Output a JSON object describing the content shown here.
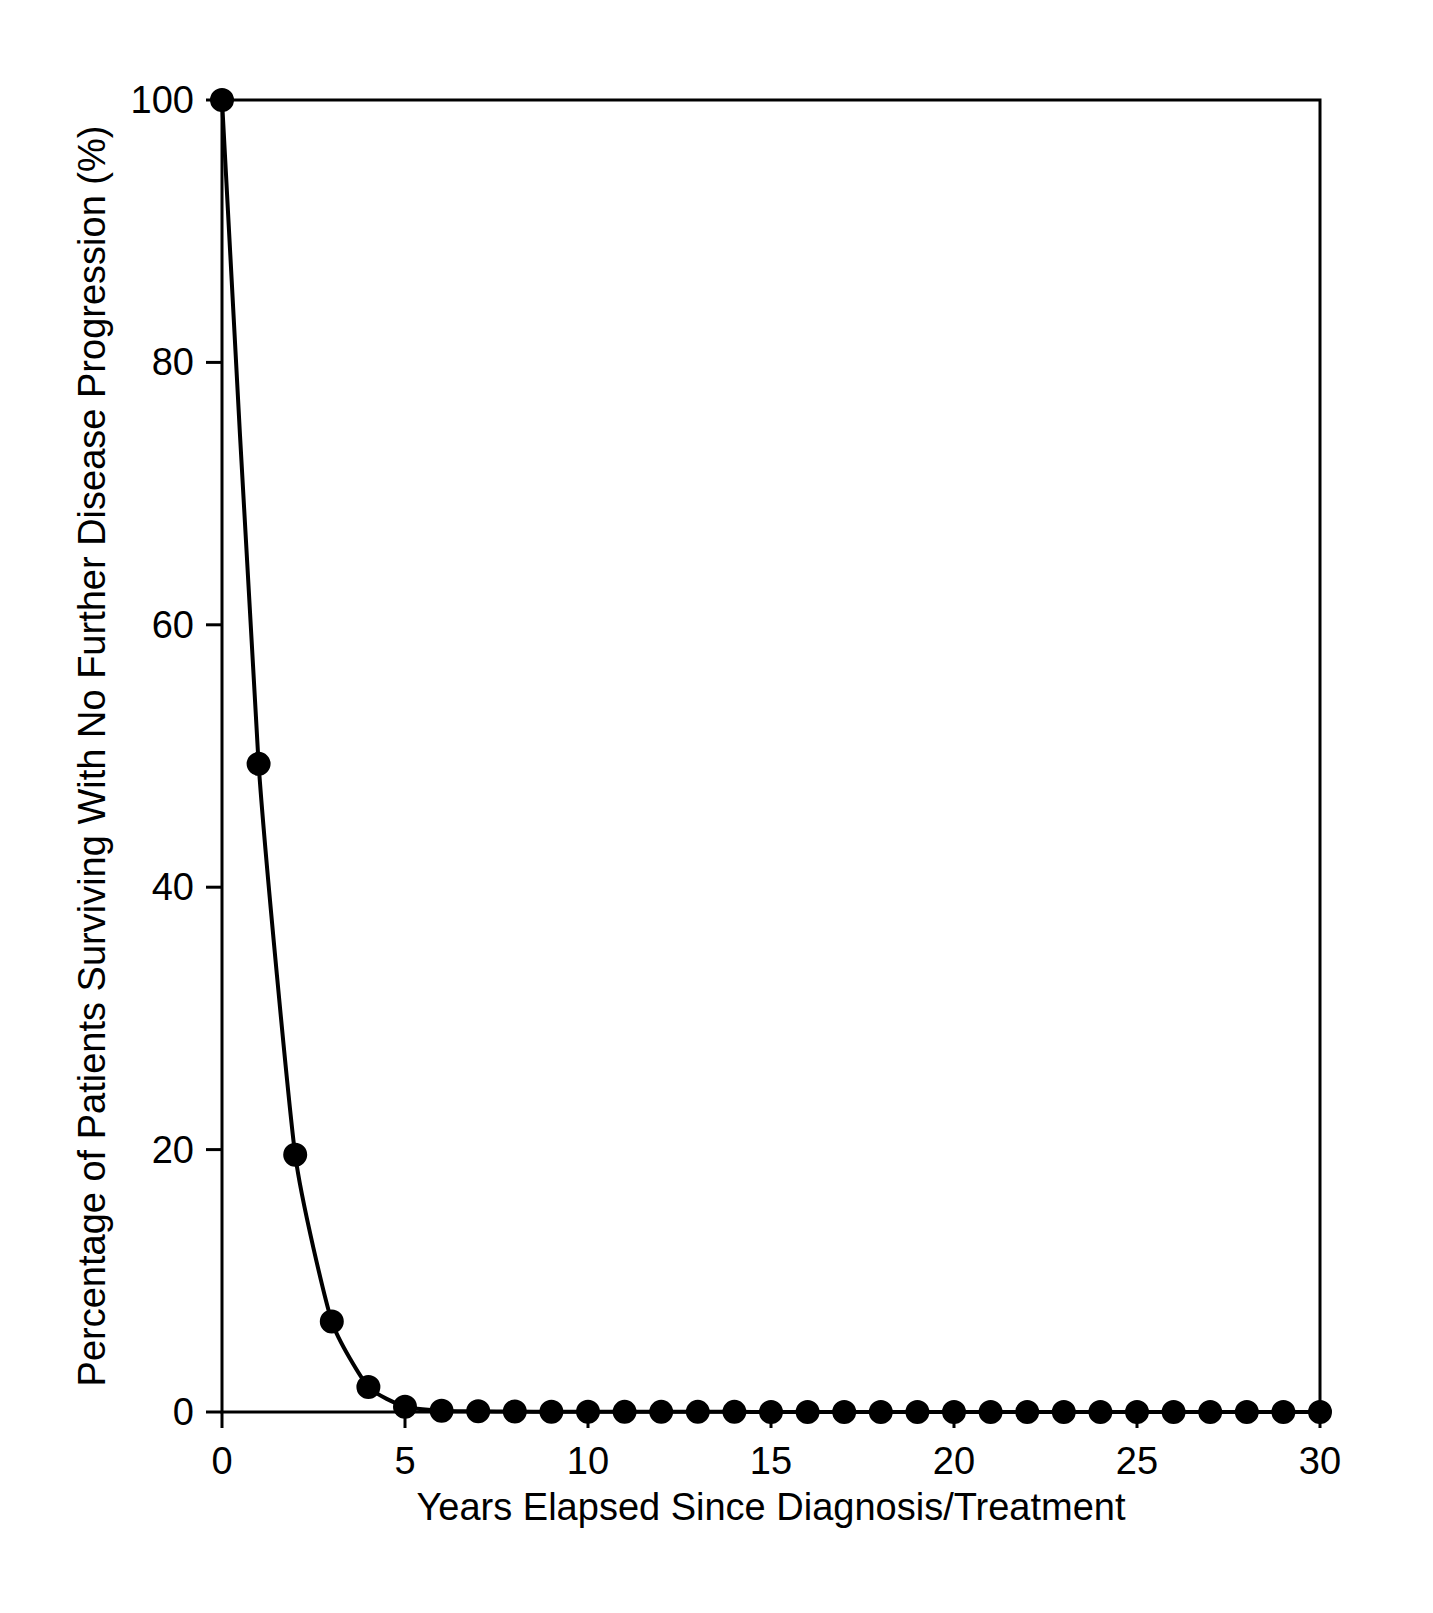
{
  "chart_data": {
    "type": "line",
    "title": "",
    "xlabel": "Years Elapsed Since Diagnosis/Treatment",
    "ylabel": "Percentage of Patients Surviving With No Further Disease Progression (%)",
    "xlim": [
      0,
      30
    ],
    "ylim": [
      0,
      100
    ],
    "xticks": [
      0,
      5,
      10,
      15,
      20,
      25,
      30
    ],
    "yticks": [
      0,
      20,
      40,
      60,
      80,
      100
    ],
    "xtick_labels": [
      "0",
      "5",
      "10",
      "15",
      "20",
      "25",
      "30"
    ],
    "ytick_labels": [
      "0",
      "20",
      "40",
      "60",
      "80",
      "100"
    ],
    "grid": false,
    "legend": "none",
    "marker": "filled-circle",
    "line_color": "#000000",
    "marker_color": "#000000",
    "background_color": "#ffffff",
    "series": [
      {
        "name": "Progression-free survival",
        "x": [
          0,
          1,
          2,
          3,
          4,
          5,
          6,
          7,
          8,
          9,
          10,
          11,
          12,
          13,
          14,
          15,
          16,
          17,
          18,
          19,
          20,
          21,
          22,
          23,
          24,
          25,
          26,
          27,
          28,
          29,
          30
        ],
        "values": [
          100,
          49.4,
          19.6,
          6.9,
          1.9,
          0.4,
          0.1,
          0.05,
          0.03,
          0.02,
          0.02,
          0.01,
          0.01,
          0.01,
          0.01,
          0,
          0,
          0,
          0,
          0,
          0,
          0,
          0,
          0,
          0,
          0,
          0,
          0,
          0,
          0,
          0
        ]
      }
    ]
  },
  "axes": {
    "x_axis_name": "x-axis",
    "y_axis_name": "y-axis"
  }
}
